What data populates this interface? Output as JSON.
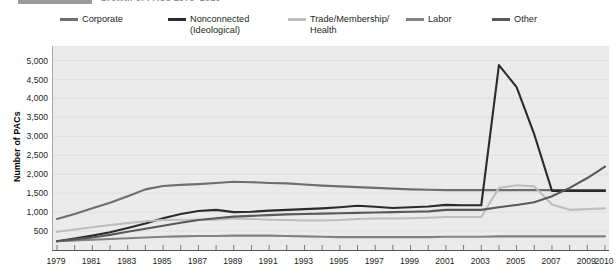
{
  "title": {
    "prefix_swatch": true,
    "text": "Growth of PACs 1979–2010"
  },
  "axis": {
    "ylabel": "Number of PACs",
    "yticks": [
      "500",
      "1,000",
      "1,500",
      "2,000",
      "2,500",
      "3,000",
      "3,500",
      "4,000",
      "4,500",
      "5,000"
    ],
    "xticks": [
      "1979",
      "1981",
      "1983",
      "1985",
      "1987",
      "1989",
      "1991",
      "1993",
      "1995",
      "1997",
      "1999",
      "2001",
      "2003",
      "2005",
      "2007",
      "2009",
      "2010"
    ]
  },
  "legend": [
    {
      "label": "Corporate",
      "color": "#6d6e71"
    },
    {
      "label": "Nonconnected\n(Ideological)",
      "color": "#2b2b2b"
    },
    {
      "label": "Trade/Membership/\nHealth",
      "color": "#bcbec0"
    },
    {
      "label": "Labor",
      "color": "#808285"
    },
    {
      "label": "Other",
      "color": "#58595b"
    }
  ],
  "chart_data": {
    "type": "line",
    "title": "Growth of PACs 1979–2010",
    "xlabel": "",
    "ylabel": "Number of PACs",
    "ylim": [
      0,
      5000
    ],
    "grid": true,
    "legend_position": "top",
    "x": [
      1979,
      1980,
      1981,
      1982,
      1983,
      1984,
      1985,
      1986,
      1987,
      1988,
      1989,
      1990,
      1991,
      1992,
      1993,
      1994,
      1995,
      1996,
      1997,
      1998,
      1999,
      2000,
      2001,
      2002,
      2003,
      2004,
      2005,
      2006,
      2007,
      2008,
      2009,
      2010
    ],
    "series": [
      {
        "name": "Corporate",
        "color": "#6d6e71",
        "values": [
          820,
          950,
          1100,
          1250,
          1420,
          1600,
          1690,
          1720,
          1740,
          1770,
          1800,
          1790,
          1770,
          1760,
          1730,
          1700,
          1680,
          1660,
          1640,
          1620,
          1600,
          1590,
          1580,
          1580,
          1580,
          1580,
          1580,
          1580,
          1580,
          1580,
          1580,
          1580
        ]
      },
      {
        "name": "Nonconnected (Ideological)",
        "color": "#2b2b2b",
        "values": [
          230,
          300,
          380,
          470,
          580,
          700,
          840,
          950,
          1030,
          1060,
          1000,
          1010,
          1040,
          1060,
          1080,
          1100,
          1130,
          1170,
          1140,
          1110,
          1130,
          1150,
          1190,
          1180,
          1180,
          4880,
          4300,
          3050,
          1560,
          1560,
          1560,
          1560
        ]
      },
      {
        "name": "Trade/Membership/Health",
        "color": "#bcbec0",
        "values": [
          480,
          540,
          600,
          660,
          710,
          760,
          790,
          800,
          800,
          800,
          830,
          820,
          800,
          790,
          780,
          780,
          790,
          820,
          830,
          830,
          840,
          850,
          870,
          870,
          870,
          1640,
          1710,
          1680,
          1200,
          1060,
          1080,
          1100
        ]
      },
      {
        "name": "Labor",
        "color": "#808285",
        "values": [
          230,
          250,
          270,
          290,
          310,
          330,
          350,
          360,
          370,
          370,
          380,
          380,
          380,
          370,
          360,
          350,
          340,
          340,
          340,
          340,
          340,
          340,
          350,
          350,
          350,
          360,
          360,
          360,
          360,
          360,
          360,
          360
        ]
      },
      {
        "name": "Other",
        "color": "#58595b",
        "values": [
          230,
          280,
          330,
          400,
          480,
          560,
          640,
          720,
          790,
          840,
          880,
          900,
          920,
          940,
          950,
          960,
          970,
          980,
          990,
          1000,
          1010,
          1020,
          1060,
          1060,
          1060,
          1130,
          1190,
          1260,
          1420,
          1640,
          1900,
          2200
        ]
      }
    ]
  }
}
